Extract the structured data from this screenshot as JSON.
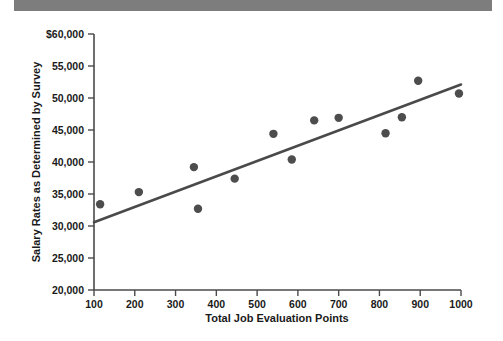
{
  "page": {
    "scan_bar_color": "#7d7d7d",
    "background_color": "#ffffff"
  },
  "chart_data": {
    "type": "scatter",
    "title": "",
    "subtitle": "",
    "xlabel": "Total Job Evaluation Points",
    "ylabel": "Salary Rates as Determined by Survey",
    "xlim": [
      100,
      1000
    ],
    "ylim": [
      20000,
      60000
    ],
    "grid": false,
    "legend": null,
    "marker_color": "#4d4d4d",
    "line_color": "#4a4a4a",
    "xticks": [
      100,
      200,
      300,
      400,
      500,
      600,
      700,
      800,
      900,
      1000
    ],
    "xtick_labels": [
      "100",
      "200",
      "300",
      "400",
      "500",
      "600",
      "700",
      "800",
      "900",
      "1000"
    ],
    "yticks": [
      20000,
      25000,
      30000,
      35000,
      40000,
      45000,
      50000,
      55000,
      60000
    ],
    "ytick_labels": [
      "20,000",
      "25,000",
      "30,000",
      "35,000",
      "40,000",
      "45,000",
      "50,000",
      "55,000",
      "$60,000"
    ],
    "points": [
      {
        "x": 115,
        "y": 33400
      },
      {
        "x": 210,
        "y": 35300
      },
      {
        "x": 345,
        "y": 39200
      },
      {
        "x": 355,
        "y": 32700
      },
      {
        "x": 445,
        "y": 37400
      },
      {
        "x": 540,
        "y": 44400
      },
      {
        "x": 585,
        "y": 40400
      },
      {
        "x": 640,
        "y": 46500
      },
      {
        "x": 700,
        "y": 46900
      },
      {
        "x": 815,
        "y": 44500
      },
      {
        "x": 855,
        "y": 47000
      },
      {
        "x": 895,
        "y": 52700
      },
      {
        "x": 995,
        "y": 50700
      }
    ],
    "trendline": {
      "name": "regression-line",
      "x_start": 100,
      "y_start": 30600,
      "x_end": 1000,
      "y_end": 52100
    }
  }
}
